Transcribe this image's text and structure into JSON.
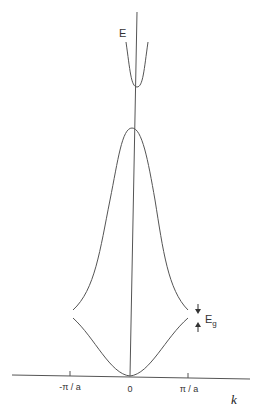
{
  "diagram": {
    "type": "band-structure",
    "y_axis_label": "E",
    "x_axis_label": "k",
    "tick_labels": [
      "-π / a",
      "0",
      "π / a"
    ],
    "gap_label": "E",
    "gap_label_sub": "g",
    "bands": [
      {
        "name": "lower-band",
        "shape": "parabola-up",
        "range": "-π/a to π/a",
        "min_at": "0"
      },
      {
        "name": "upper-band",
        "shape": "peak-at-zero",
        "range": "-π/a to π/a",
        "max_at": "0"
      },
      {
        "name": "top-band",
        "shape": "parabola-up",
        "min_at": "0"
      }
    ],
    "colors": {
      "line": "#555555",
      "text": "#333333"
    }
  }
}
